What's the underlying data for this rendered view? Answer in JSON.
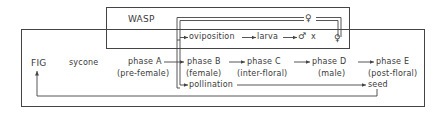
{
  "diagram": {
    "wasp_box": {
      "title": "WASP"
    },
    "fig_box": {
      "title": "FIG",
      "subtitle": "sycone"
    },
    "wasp_sequence": {
      "female_symbol": "♀",
      "steps": [
        "oviposition",
        "larva",
        "♂ x ♀"
      ],
      "mating_male": "♂",
      "mating_x": "x",
      "mating_female": "♀"
    },
    "fig_phases": [
      {
        "name": "phase  A",
        "description": "(pre-female)"
      },
      {
        "name": "phase  B",
        "description": "(female)"
      },
      {
        "name": "phase  C",
        "description": "(inter-floral)"
      },
      {
        "name": "phase  D",
        "description": "(male)"
      },
      {
        "name": "phase  E",
        "description": "(post-floral)"
      }
    ],
    "pollination": {
      "label": "pollination",
      "result": "seed"
    },
    "connections": [
      {
        "from": "♀ (wasp)",
        "to": "oviposition"
      },
      {
        "from": "♀ (wasp)",
        "to": "pollination"
      },
      {
        "from": "oviposition",
        "to": "larva"
      },
      {
        "from": "larva",
        "to": "♂ x ♀"
      },
      {
        "from": "♂ x ♀",
        "to": "♀ (wasp)"
      },
      {
        "from": "phase A",
        "to": "phase B"
      },
      {
        "from": "phase B",
        "to": "phase C"
      },
      {
        "from": "phase C",
        "to": "phase D"
      },
      {
        "from": "phase D",
        "to": "phase E"
      },
      {
        "from": "pollination",
        "to": "seed"
      },
      {
        "from": "seed",
        "to": "FIG"
      }
    ],
    "colors": {
      "line": "#444444",
      "text": "#3a3a3a",
      "background": "#ffffff"
    }
  }
}
